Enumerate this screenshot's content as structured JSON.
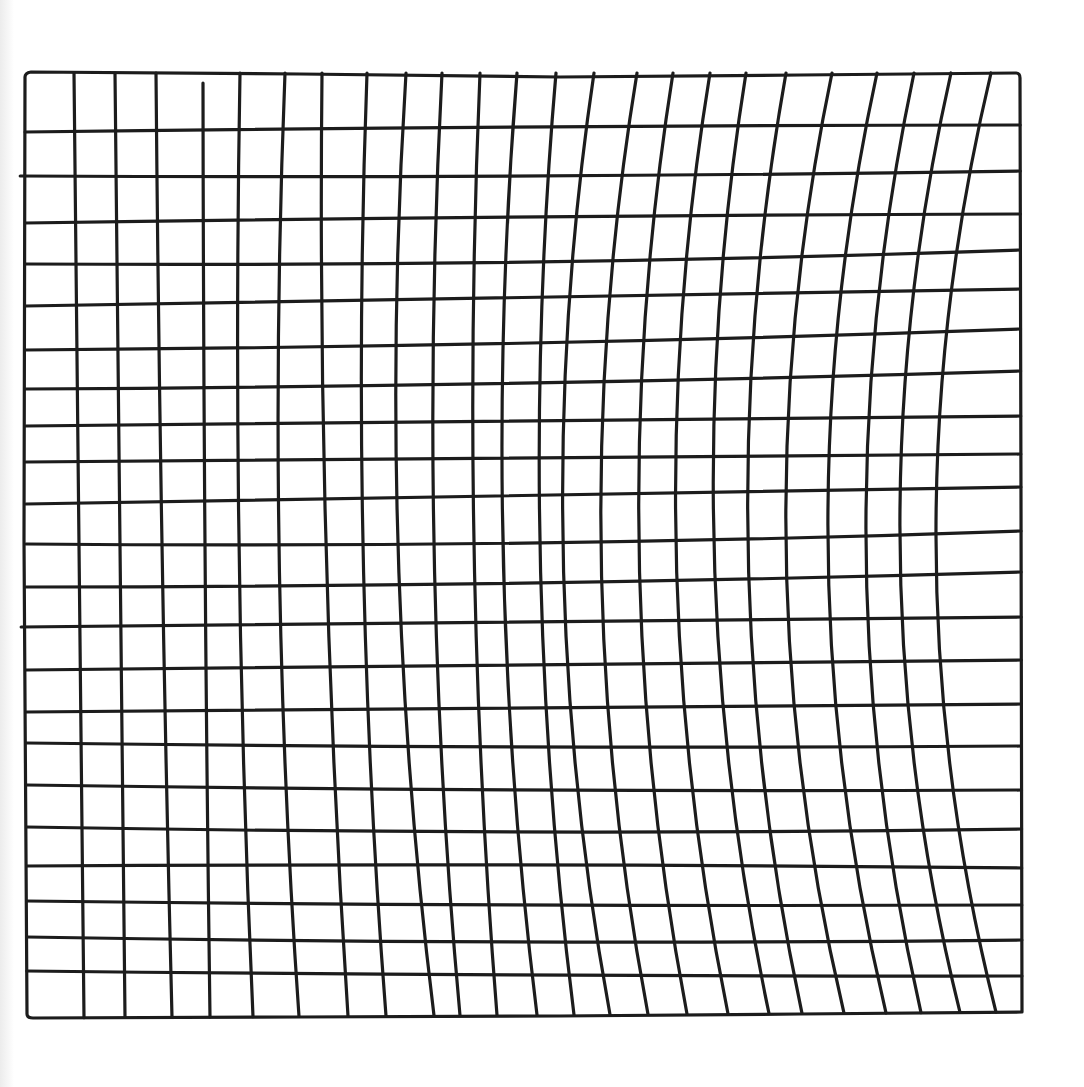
{
  "drawing": {
    "description": "Hand-drawn square grid in black ink on white paper",
    "columns": 25,
    "rows": 23,
    "ink_color": "#1c1c1c",
    "paper_color": "#ffffff"
  }
}
